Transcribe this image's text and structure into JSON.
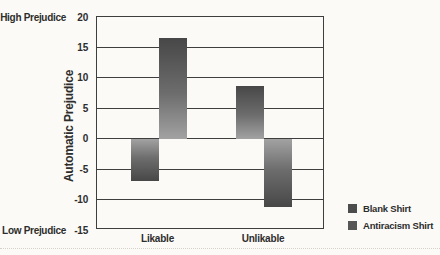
{
  "chart_data": {
    "type": "bar",
    "title": "",
    "xlabel": "",
    "ylabel": "Automatic Prejudice",
    "categories": [
      "Likable",
      "Unlikable"
    ],
    "series": [
      {
        "name": "Blank Shirt",
        "values": [
          -7,
          8.7
        ],
        "color": "#4c4c4c"
      },
      {
        "name": "Antiracism Shirt",
        "values": [
          16.5,
          -11.3
        ],
        "color": "#565656"
      }
    ],
    "yticks": [
      20,
      15,
      10,
      5,
      0,
      -5,
      -10,
      -15
    ],
    "ylim": [
      -15,
      20
    ],
    "grid": "horizontal",
    "legend_position": "right-bottom",
    "y_axis_annotations": {
      "top": "High Prejudice",
      "bottom": "Low Prejudice"
    },
    "colors": {
      "background": "#fbfaf6",
      "gridline": "#3e3e3e",
      "text": "#2d2d2d",
      "bar_gradient_dark": "#474747",
      "bar_gradient_light": "#a2a2a2"
    }
  }
}
